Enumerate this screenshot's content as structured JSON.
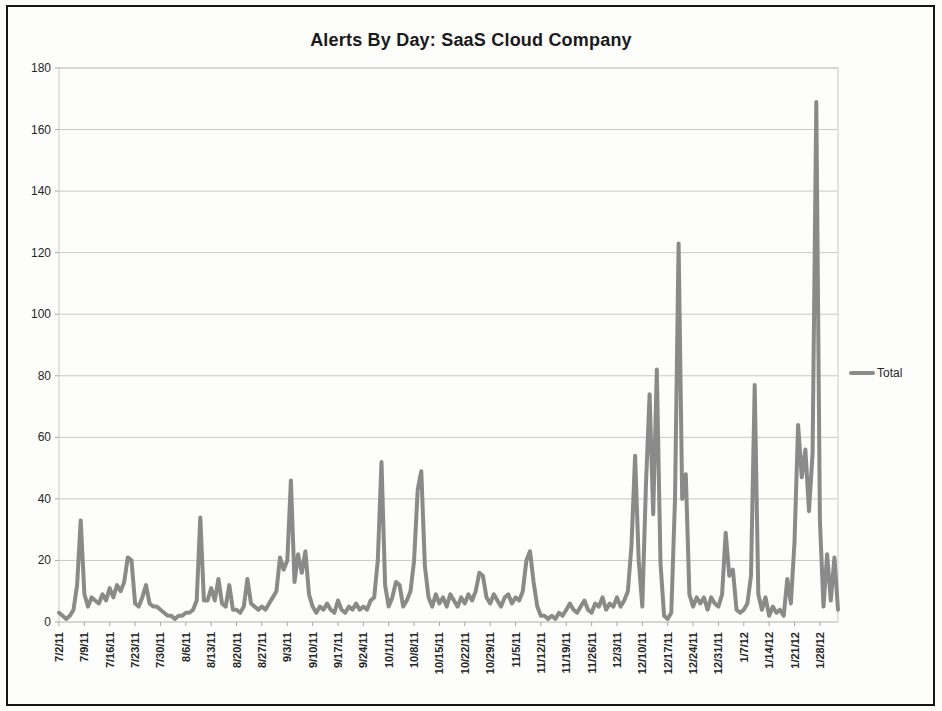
{
  "figure": {
    "title": "Alerts By Day:  SaaS Cloud Company"
  },
  "legend": {
    "label": "Total"
  },
  "colors": {
    "line": "#8a8a8a",
    "grid": "#c9c9c9",
    "border": "#c9c9c9",
    "tick": "#a8a8a8",
    "axis_text": "#262626",
    "frame": "#161616"
  },
  "chart_data": {
    "type": "line",
    "title": "Alerts By Day:  SaaS Cloud Company",
    "xlabel": "",
    "ylabel": "",
    "ylim": [
      0,
      180
    ],
    "y_ticks": [
      0,
      20,
      40,
      60,
      80,
      100,
      120,
      140,
      160,
      180
    ],
    "grid": "horizontal",
    "legend_position": "right",
    "x_is_daily_dates": true,
    "x_start_date": "7/2/11",
    "x_label_interval_days": 7,
    "x_tick_labels": [
      "7/2/11",
      "7/9/11",
      "7/16/11",
      "7/23/11",
      "7/30/11",
      "8/6/11",
      "8/13/11",
      "8/20/11",
      "8/27/11",
      "9/3/11",
      "9/10/11",
      "9/17/11",
      "9/24/11",
      "10/1/11",
      "10/8/11",
      "10/15/11",
      "10/22/11",
      "10/29/11",
      "11/5/11",
      "11/12/11",
      "11/19/11",
      "11/26/11",
      "12/3/11",
      "12/10/11",
      "12/17/11",
      "12/24/11",
      "12/31/11",
      "1/7/12",
      "1/14/12",
      "1/21/12",
      "1/28/12"
    ],
    "series": [
      {
        "name": "Total",
        "color": "#8a8a8a",
        "values": [
          3,
          2,
          1,
          2,
          4,
          12,
          33,
          9,
          5,
          8,
          7,
          6,
          9,
          7,
          11,
          8,
          12,
          10,
          13,
          21,
          20,
          6,
          5,
          8,
          12,
          6,
          5,
          5,
          4,
          3,
          2,
          2,
          1,
          2,
          2,
          3,
          3,
          4,
          7,
          34,
          7,
          7,
          11,
          7,
          14,
          6,
          5,
          12,
          4,
          4,
          3,
          5,
          14,
          6,
          5,
          4,
          5,
          4,
          6,
          8,
          10,
          21,
          17,
          20,
          46,
          13,
          22,
          16,
          23,
          9,
          5,
          3,
          5,
          4,
          6,
          4,
          3,
          7,
          4,
          3,
          5,
          4,
          6,
          4,
          5,
          4,
          7,
          8,
          20,
          52,
          12,
          5,
          8,
          13,
          12,
          5,
          7,
          10,
          20,
          43,
          49,
          18,
          8,
          5,
          9,
          6,
          8,
          5,
          9,
          7,
          5,
          8,
          6,
          9,
          7,
          10,
          16,
          15,
          8,
          6,
          9,
          7,
          5,
          8,
          9,
          6,
          8,
          7,
          10,
          20,
          23,
          13,
          5,
          2,
          2,
          1,
          2,
          1,
          3,
          2,
          4,
          6,
          4,
          3,
          5,
          7,
          4,
          3,
          6,
          5,
          8,
          4,
          6,
          5,
          8,
          5,
          7,
          10,
          25,
          54,
          20,
          5,
          45,
          74,
          35,
          82,
          19,
          2,
          1,
          3,
          40,
          123,
          40,
          48,
          9,
          5,
          8,
          6,
          8,
          4,
          8,
          6,
          5,
          9,
          29,
          15,
          17,
          4,
          3,
          4,
          6,
          15,
          77,
          9,
          4,
          8,
          2,
          5,
          3,
          4,
          2,
          14,
          6,
          26,
          64,
          47,
          56,
          36,
          55,
          169,
          33,
          5,
          22,
          7,
          21,
          4
        ]
      }
    ]
  }
}
